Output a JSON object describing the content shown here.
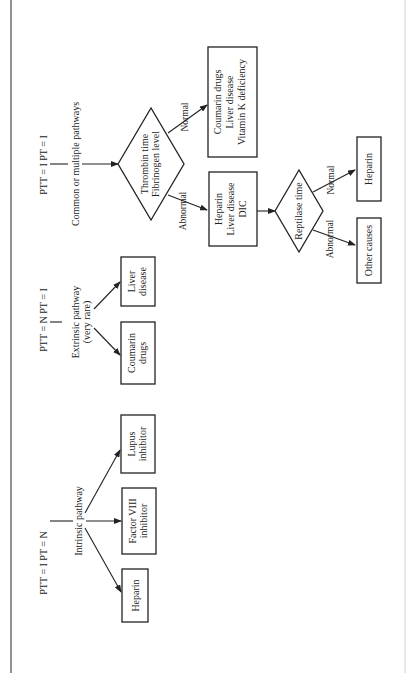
{
  "diagram": {
    "orientation": "rotated-90-ccw",
    "colors": {
      "ink": "#222222",
      "background": "#ffffff",
      "frame": "#555555"
    },
    "branches": [
      {
        "id": "intrinsic",
        "condition": "PTT = I   PT = N",
        "label": "Intrinsic pathway",
        "outcomes": [
          "Heparin",
          "Factor VIII|inhibitor",
          "Lupus|inhibitor"
        ]
      },
      {
        "id": "extrinsic",
        "condition": "PTT = N   PT = I",
        "label": "Extrinsic pathway|(very rare)",
        "outcomes": [
          "Coumarin|drugs",
          "Liver|disease"
        ]
      },
      {
        "id": "common",
        "condition": "PTT = I   PT = I",
        "label": "Common or multiple pathways",
        "decision": {
          "text": "Thrombin time|Fibrinogen level",
          "normal": {
            "edge_label": "Normal",
            "outcome": "Coumarin drugs|Liver disease|Vitamin K deficiency"
          },
          "abnormal": {
            "edge_label": "Abnormal",
            "outcome": "Heparin|Liver disease|DIC",
            "decision": {
              "text": "Reptilase time",
              "normal": {
                "edge_label": "Normal",
                "outcome": "Heparin"
              },
              "abnormal": {
                "edge_label": "Abnormal",
                "outcome": "Other causes"
              }
            }
          }
        }
      }
    ]
  },
  "text": {
    "cond_intrinsic": "PTT = I   PT = N",
    "cond_extrinsic": "PTT = N   PT = I",
    "cond_common": "PTT = I   PT = I",
    "lbl_intrinsic": "Intrinsic pathway",
    "lbl_extrinsic_1": "Extrinsic pathway",
    "lbl_extrinsic_2": "(very rare)",
    "lbl_common": "Common or multiple pathways",
    "out_heparin_left": "Heparin",
    "out_factor8_1": "Factor VIII",
    "out_factor8_2": "inhibitor",
    "out_lupus_1": "Lupus",
    "out_lupus_2": "inhibitor",
    "out_coumarin_1": "Coumarin",
    "out_coumarin_2": "drugs",
    "out_liver_1": "Liver",
    "out_liver_2": "disease",
    "dec_thrombin_1": "Thrombin time",
    "dec_thrombin_2": "Fibrinogen level",
    "edge_normal_1": "Normal",
    "edge_abnormal_1": "Abnormal",
    "out_normal_1": "Coumarin drugs",
    "out_normal_2": "Liver disease",
    "out_normal_3": "Vitamin K deficiency",
    "out_abn_1": "Heparin",
    "out_abn_2": "Liver disease",
    "out_abn_3": "DIC",
    "dec_reptilase": "Reptilase time",
    "edge_normal_2": "Normal",
    "edge_abnormal_2": "Abnormal",
    "out_heparin_right": "Heparin",
    "out_other": "Other causes"
  }
}
